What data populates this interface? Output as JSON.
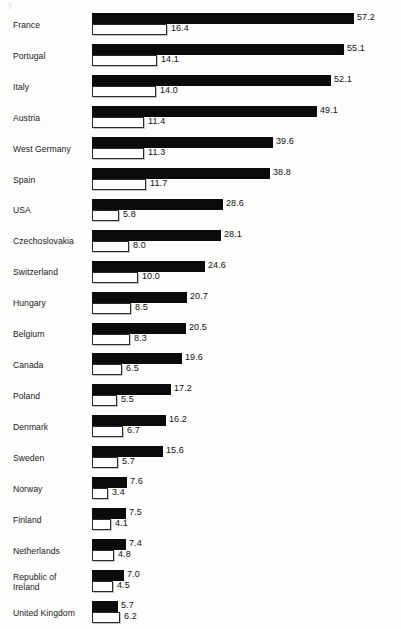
{
  "artifact": {
    "mark": "y"
  },
  "chart_data": {
    "type": "bar",
    "orientation": "horizontal",
    "title": "",
    "subtitle": "",
    "xlabel": "",
    "ylabel": "",
    "grid": false,
    "legend_position": "none",
    "xlim": [
      0,
      57.2
    ],
    "axis_scale_px_per_unit": 4.58,
    "bar_origin_x_px": 92,
    "categories": [
      "France",
      "Portugal",
      "Italy",
      "Austria",
      "West Germany",
      "Spain",
      "USA",
      "Czechoslovakia",
      "Switzerland",
      "Hungary",
      "Belgium",
      "Canada",
      "Poland",
      "Denmark",
      "Sweden",
      "Norway",
      "Finland",
      "Netherlands",
      "Republic of\nIreland",
      "United Kingdom"
    ],
    "series": [
      {
        "name": "series-black",
        "style": "filled-black",
        "values": [
          57.2,
          55.1,
          52.1,
          49.1,
          39.6,
          38.8,
          28.6,
          28.1,
          24.6,
          20.7,
          20.5,
          19.6,
          17.2,
          16.2,
          15.6,
          7.6,
          7.5,
          7.4,
          7.0,
          5.7
        ],
        "labels": [
          "57.2",
          "55.1",
          "52.1",
          "49.1",
          "39.6",
          "38.8",
          "28.6",
          "28.1",
          "24.6",
          "20.7",
          "20.5",
          "19.6",
          "17.2",
          "16.2",
          "15.6",
          "7.6",
          "7.5",
          "7.4",
          "7.0",
          "5.7"
        ]
      },
      {
        "name": "series-white",
        "style": "outlined-white",
        "values": [
          16.4,
          14.1,
          14.0,
          11.4,
          11.3,
          11.7,
          5.8,
          8.0,
          10.0,
          8.5,
          8.3,
          6.5,
          5.5,
          6.7,
          5.7,
          3.4,
          4.1,
          4.8,
          4.5,
          6.2
        ],
        "labels": [
          "16.4",
          "14.1",
          "14.0",
          "11.4",
          "11.3",
          "11.7",
          "5.8",
          "8.0",
          "10.0",
          "8.5",
          "8.3",
          "6.5",
          "5.5",
          "6.7",
          "5.7",
          "3.4",
          "4.1",
          "4.8",
          "4.5",
          "6.2"
        ]
      }
    ]
  }
}
